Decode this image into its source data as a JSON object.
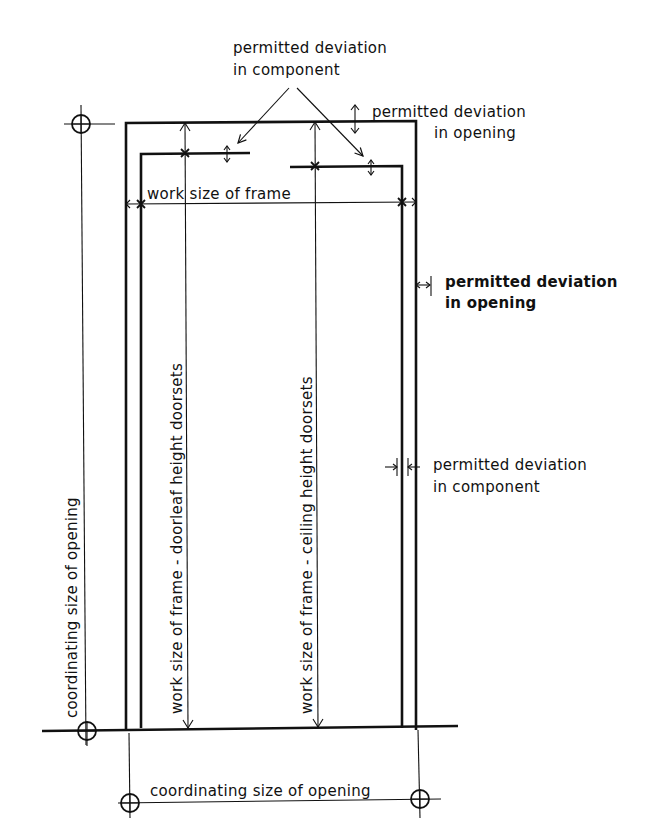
{
  "diagram": {
    "type": "technical-drawing",
    "colors": {
      "ink": "#111111",
      "background": "#ffffff"
    },
    "labels": {
      "top_component_1": "permitted deviation",
      "top_component_2": "in component",
      "top_opening_1": "permitted deviation",
      "top_opening_2": "in opening",
      "frame_width": "work size of frame",
      "right_opening_1": "permitted deviation",
      "right_opening_2": "in opening",
      "right_component_1": "permitted deviation",
      "right_component_2": "in component",
      "coord_height": "coordinating size of opening",
      "doorleaf_height": "work size of frame - doorleaf height doorsets",
      "ceiling_height": "work size of frame - ceiling height doorsets",
      "coord_width": "coordinating size of opening"
    },
    "symbols": [
      "datum-circle-top-left",
      "datum-circle-bottom-left",
      "datum-circle-bottom-under-left",
      "datum-circle-bottom-under-right"
    ]
  }
}
